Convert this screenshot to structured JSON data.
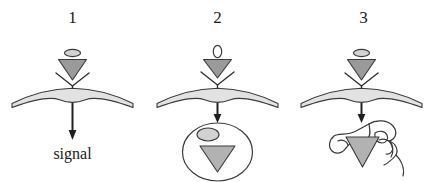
{
  "figure": {
    "background_color": "#ffffff",
    "width": 436,
    "height": 182
  },
  "colors": {
    "outline": "#3a3a3a",
    "ligand_fill": "#9a9a9a",
    "ligand_ellipse_fill": "#d2d2d2",
    "membrane_fill": "#e2e2e2",
    "vesicle_fill": "#ffffff",
    "vesicle_blob_fill": "#c9c9c9",
    "text": "#1a1a1a",
    "arrow": "#202020"
  },
  "panels": [
    {
      "number": "1",
      "ligand_label": "",
      "caption": "signal",
      "fate": "signal-transduction",
      "icons": {
        "ligand": "triangle-ligand-icon",
        "ligand_cap": "ellipse-ligand-cap-icon",
        "receptor": "y-receptor-icon",
        "membrane": "cell-membrane-icon",
        "arrow": "down-arrow-icon"
      }
    },
    {
      "number": "2",
      "ligand_label": "0",
      "caption": "",
      "fate": "endosome-vesicle",
      "icons": {
        "ligand": "triangle-ligand-icon",
        "ligand_cap": "ellipse-ligand-cap-icon",
        "receptor": "y-receptor-icon",
        "membrane": "cell-membrane-icon",
        "arrow": "down-arrow-icon",
        "compartment": "endosome-vesicle-icon",
        "compartment_inclusion": "vesicle-inclusion-ellipse-icon"
      }
    },
    {
      "number": "3",
      "ligand_label": "",
      "caption": "",
      "fate": "lysosome-degradation",
      "icons": {
        "ligand": "triangle-ligand-icon",
        "ligand_cap": "ellipse-ligand-cap-icon",
        "receptor": "y-receptor-icon",
        "membrane": "cell-membrane-icon",
        "arrow": "down-arrow-icon",
        "compartment": "lysosome-blob-icon"
      }
    }
  ]
}
